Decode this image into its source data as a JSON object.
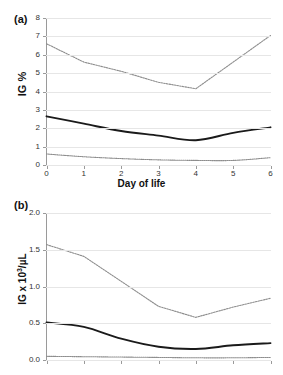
{
  "figure": {
    "panel_a_label": "(a)",
    "panel_b_label": "(b)",
    "xlabel": "Day of life",
    "ylabel_a": "IG %",
    "ylabel_b_main": "IG x 10",
    "ylabel_b_sup": "3",
    "ylabel_b_tail": "/µL"
  },
  "colors": {
    "upper_series": "#8d8d8d",
    "middle_series": "#1a1a1a",
    "lower_series": "#8d8d8d",
    "gridline": "#e6e6e6",
    "axis": "#9a9a9a",
    "text": "#111111"
  },
  "chart_data": [
    {
      "type": "line",
      "panel": "(a)",
      "title": "",
      "xlabel": "Day of life",
      "ylabel": "IG %",
      "x": [
        0,
        1,
        2,
        3,
        4,
        5,
        6
      ],
      "xticks": [
        "0",
        "1",
        "2",
        "3",
        "4",
        "5",
        "6"
      ],
      "yticks": [
        "0",
        "1",
        "2",
        "3",
        "4",
        "5",
        "6",
        "7",
        "8"
      ],
      "xlim": [
        0,
        6
      ],
      "ylim": [
        0,
        8
      ],
      "grid": true,
      "legend": "none",
      "series": [
        {
          "name": "upper",
          "style": "dotted",
          "values": [
            6.6,
            5.6,
            5.1,
            4.5,
            4.15,
            5.6,
            7.05
          ]
        },
        {
          "name": "middle",
          "style": "solid",
          "values": [
            2.65,
            2.25,
            1.85,
            1.6,
            1.35,
            1.75,
            2.05
          ]
        },
        {
          "name": "lower",
          "style": "dotted",
          "values": [
            0.6,
            0.45,
            0.35,
            0.28,
            0.25,
            0.25,
            0.4
          ]
        }
      ]
    },
    {
      "type": "line",
      "panel": "(b)",
      "title": "",
      "xlabel": "Day of life",
      "ylabel": "IG x 10³/µL",
      "x": [
        0,
        1,
        2,
        3,
        4,
        5,
        6
      ],
      "xticks": [],
      "yticks": [
        "0.0",
        "0.5",
        "1.0",
        "1.5",
        "2.0"
      ],
      "xlim": [
        0,
        6
      ],
      "ylim": [
        0,
        2.0
      ],
      "grid": true,
      "legend": "none",
      "series": [
        {
          "name": "upper",
          "style": "dotted",
          "values": [
            1.57,
            1.41,
            1.07,
            0.73,
            0.58,
            0.72,
            0.84
          ]
        },
        {
          "name": "middle",
          "style": "solid",
          "values": [
            0.51,
            0.45,
            0.29,
            0.18,
            0.15,
            0.2,
            0.23
          ]
        },
        {
          "name": "lower",
          "style": "dotted",
          "values": [
            0.05,
            0.045,
            0.04,
            0.035,
            0.03,
            0.03,
            0.035
          ]
        }
      ]
    }
  ]
}
